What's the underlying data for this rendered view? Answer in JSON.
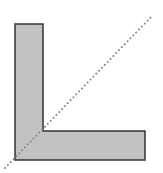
{
  "diagram": {
    "type": "l-shape-with-symmetry-axis",
    "canvas": {
      "width": 163,
      "height": 173,
      "background": "#ffffff"
    },
    "shape": {
      "name": "L-shape",
      "points": [
        [
          15,
          24
        ],
        [
          43,
          24
        ],
        [
          43,
          131
        ],
        [
          145,
          131
        ],
        [
          145,
          160
        ],
        [
          15,
          160
        ]
      ],
      "fill": "#c2c2c2",
      "stroke": "#333333",
      "stroke_width": 1.5
    },
    "axis": {
      "name": "symmetry-axis",
      "x1": 5,
      "y1": 168,
      "x2": 153,
      "y2": 15,
      "color": "#8a8a8a",
      "style": "dotted"
    }
  }
}
